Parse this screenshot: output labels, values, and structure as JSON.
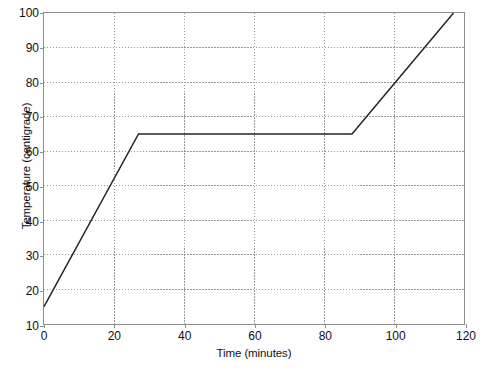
{
  "chart_data": {
    "type": "line",
    "title": "",
    "xlabel": "Time (minutes)",
    "ylabel": "Temperature (centigrade)",
    "xlim": [
      0,
      120
    ],
    "ylim": [
      10,
      100
    ],
    "xticks": [
      0,
      20,
      40,
      60,
      80,
      100,
      120
    ],
    "yticks": [
      10,
      20,
      30,
      40,
      50,
      60,
      70,
      80,
      90,
      100
    ],
    "xtick_labels": [
      "0",
      "20",
      "40",
      "60",
      "80",
      "100",
      "120"
    ],
    "ytick_labels": [
      "10",
      "20",
      "30",
      "40",
      "50",
      "60",
      "70",
      "80",
      "90",
      "100"
    ],
    "grid": true,
    "grid_style": "dotted",
    "grid_color": "#9a9a9a",
    "legend": null,
    "series": [
      {
        "name": "heating curve",
        "color": "#262626",
        "line_width": 1.5,
        "x": [
          0,
          27,
          88,
          117
        ],
        "y": [
          15,
          65,
          65,
          100
        ],
        "points": [
          {
            "x": 0,
            "y": 15
          },
          {
            "x": 27,
            "y": 65
          },
          {
            "x": 88,
            "y": 65
          },
          {
            "x": 117,
            "y": 100
          }
        ]
      }
    ]
  },
  "figure": {
    "background_color": "#fefefe",
    "plot_background_color": "#ffffff",
    "axis_color": "#8e8e8e"
  }
}
